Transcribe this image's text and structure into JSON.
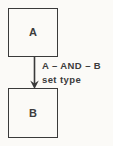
{
  "diagram": {
    "colors": {
      "background": "#fbfaf7",
      "line": "#3a3a3a",
      "text": "#3c3c3c"
    },
    "nodes": {
      "a": {
        "label": "A"
      },
      "b": {
        "label": "B"
      }
    },
    "edge": {
      "from": "A",
      "to": "B",
      "direction": "down",
      "label_line1": "A – AND – B",
      "label_line2": "set type"
    }
  }
}
